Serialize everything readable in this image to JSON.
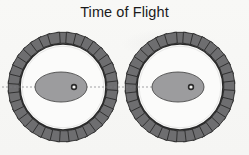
{
  "figure": {
    "title": "Time of Flight",
    "background_color": "#f7f7f5",
    "title_color": "#1b1b1b",
    "width": 249,
    "height": 155
  },
  "chart_data": {
    "type": "diagram",
    "title": "Time of Flight",
    "subtitle": "",
    "xlabel": "",
    "ylabel": "",
    "grid": false,
    "legend": "none",
    "objects": [
      {
        "name": "left-chopper-wheel",
        "center_x": 63,
        "center_y": 87,
        "disk_radius": 43,
        "tooth_count": 36,
        "tooth_inner_radius": 44,
        "tooth_outer_radius": 55,
        "tooth_angular_width_deg": 6.4,
        "disk_fill": "#fbfbfa",
        "disk_edge": "#2a2a2a",
        "tooth_fill": "#6e6e70",
        "tooth_edge": "#2a2a2a",
        "ellipse": {
          "center_x": 61,
          "center_y": 87,
          "rx": 26,
          "ry": 15,
          "fill": "#9c9c9e",
          "edge": "#4a4a4a"
        },
        "hub": {
          "center_x": 74,
          "center_y": 87,
          "outer_radius": 3.2,
          "inner_radius": 1.6,
          "ring_color": "#2b2b2b",
          "core_color": "#f2f2f0"
        }
      },
      {
        "name": "right-chopper-wheel",
        "center_x": 180,
        "center_y": 87,
        "disk_radius": 43,
        "tooth_count": 36,
        "tooth_inner_radius": 44,
        "tooth_outer_radius": 55,
        "tooth_angular_width_deg": 6.4,
        "disk_fill": "#fbfbfa",
        "disk_edge": "#2a2a2a",
        "tooth_fill": "#6e6e70",
        "tooth_edge": "#2a2a2a",
        "ellipse": {
          "center_x": 178,
          "center_y": 87,
          "rx": 26,
          "ry": 15,
          "fill": "#9c9c9e",
          "edge": "#4a4a4a"
        },
        "hub": {
          "center_x": 191,
          "center_y": 87,
          "outer_radius": 3.2,
          "inner_radius": 1.6,
          "ring_color": "#2b2b2b",
          "core_color": "#f2f2f0"
        }
      }
    ],
    "axis_line": {
      "name": "flight-axis-line",
      "x_start": 2,
      "x_end": 196,
      "y": 87,
      "color": "#7d7d80",
      "width": 0.7,
      "dash": "2,2"
    }
  }
}
